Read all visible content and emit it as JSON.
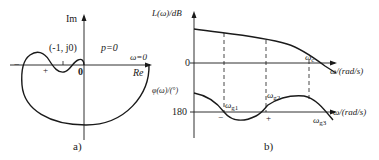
{
  "panel_a": {
    "caption": "a)",
    "im_label": "Im",
    "re_label": "Re",
    "critical_point": "(-1, j0)",
    "p_label": "p=0",
    "omega_zero_label": "ω=0",
    "origin_label": "0",
    "minus_marker": "−",
    "plus_marker": "+"
  },
  "panel_b": {
    "caption": "b)",
    "magnitude_axis": "L(ω)/dB",
    "phase_axis": "φ(ω)/(°)",
    "zero_label": "0",
    "phase_ref_label": "180",
    "freq_axis_top": "ω/(rad/s)",
    "freq_axis_bottom": "ω/(rad/s)",
    "omega_c": {
      "base": "ω",
      "sub": "c"
    },
    "omega_g1": {
      "base": "ω",
      "sub": "g1"
    },
    "omega_g2": {
      "base": "ω",
      "sub": "g2"
    },
    "omega_g3": {
      "base": "ω",
      "sub": "g3"
    },
    "minus_marker": "−",
    "plus_marker": "+"
  },
  "colors": {
    "stroke": "#1a1a1a",
    "background": "#ffffff"
  }
}
